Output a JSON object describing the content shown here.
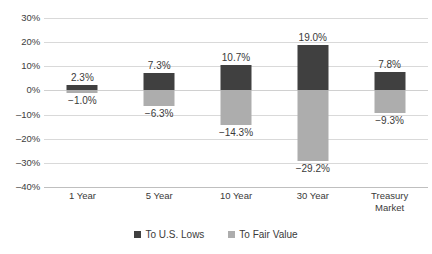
{
  "chart_data": {
    "type": "bar",
    "title": "",
    "subtitle": "",
    "xlabel": "",
    "ylabel": "",
    "ylim": [
      -40,
      30
    ],
    "ytick_step": 10,
    "grid": true,
    "legend_position": "bottom",
    "stacked_diverging": true,
    "categories": [
      "1 Year",
      "5 Year",
      "10 Year",
      "30 Year",
      "Treasury Market"
    ],
    "category_lines": [
      [
        "1 Year"
      ],
      [
        "5 Year"
      ],
      [
        "10 Year"
      ],
      [
        "30 Year"
      ],
      [
        "Treasury",
        "Market"
      ]
    ],
    "ytick_labels": [
      "30%",
      "20%",
      "10%",
      "0%",
      "-10%",
      "-20%",
      "-30%",
      "-40%"
    ],
    "ytick_values": [
      30,
      20,
      10,
      0,
      -10,
      -20,
      -30,
      -40
    ],
    "series": [
      {
        "name": "To U.S. Lows",
        "color": "#404040",
        "values": [
          2.3,
          7.3,
          10.7,
          19.0,
          7.8
        ],
        "labels": [
          "2.3%",
          "7.3%",
          "10.7%",
          "19.0%",
          "7.8%"
        ]
      },
      {
        "name": "To Fair Value",
        "color": "#adadad",
        "values": [
          -1.0,
          -6.3,
          -14.3,
          -29.2,
          -9.3
        ],
        "labels": [
          "−1.0%",
          "−6.3%",
          "−14.3%",
          "−29.2%",
          "−9.3%"
        ]
      }
    ]
  },
  "legend": {
    "items": [
      {
        "label": "To U.S. Lows",
        "color": "#404040"
      },
      {
        "label": "To Fair Value",
        "color": "#adadad"
      }
    ]
  },
  "colors": {
    "background": "#ffffff",
    "gridline": "#d9d9d9",
    "text": "#3a3a3a",
    "series_dark": "#404040",
    "series_light": "#adadad"
  }
}
